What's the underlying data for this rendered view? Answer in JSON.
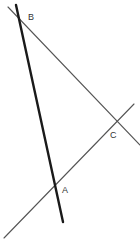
{
  "figure": {
    "width": 140,
    "height": 245,
    "background_color": "#ffffff"
  },
  "labels": {
    "a": "A",
    "b": "B",
    "c": "C"
  },
  "label_color": "#333333",
  "chart_data": {
    "type": "diagram",
    "subtype": "geometric-line-figure",
    "coordinate_system": "pixels, origin top-left, y increases downward",
    "xlim": [
      0,
      140
    ],
    "ylim": [
      0,
      245
    ],
    "grid": false,
    "legend": false,
    "points": [
      {
        "name": "B",
        "x": 22,
        "y": 17,
        "label": "B",
        "label_x": 28,
        "label_y": 13
      },
      {
        "name": "A",
        "x": 60,
        "y": 189,
        "label": "A",
        "label_x": 62,
        "label_y": 186
      },
      {
        "name": "C",
        "x": 116,
        "y": 126,
        "label": "C",
        "label_x": 110,
        "label_y": 131
      }
    ],
    "lines": [
      {
        "name": "line-BA-extended",
        "style": "thick-black",
        "color": "#1a1a1a",
        "width": 2.4,
        "x1": 16,
        "y1": 5,
        "x2": 63,
        "y2": 222,
        "through": [
          "B",
          "A"
        ]
      },
      {
        "name": "line-BC-extended",
        "style": "thin-gray",
        "color": "#555555",
        "width": 1.1,
        "x1": 8,
        "y1": 7,
        "x2": 140,
        "y2": 145,
        "through": [
          "B",
          "C"
        ]
      },
      {
        "name": "line-AC-extended",
        "style": "thin-gray",
        "color": "#555555",
        "width": 1.1,
        "x1": 4,
        "y1": 238,
        "x2": 134,
        "y2": 104,
        "through": [
          "A",
          "C"
        ]
      }
    ]
  }
}
